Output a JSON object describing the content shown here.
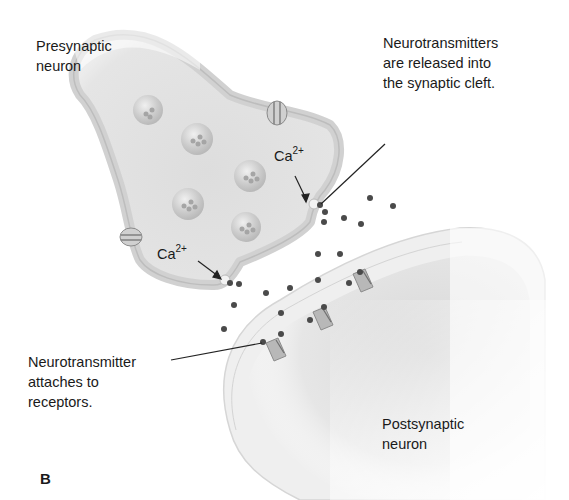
{
  "figure": {
    "panel_label": "B",
    "labels": {
      "presynaptic": "Presynaptic\nneuron",
      "postsynaptic": "Postsynaptic\nneuron",
      "release": "Neurotransmitters\nare released into\nthe synaptic cleft.",
      "attach": "Neurotransmitter\nattaches to\nreceptors."
    },
    "calcium": [
      {
        "base": "Ca",
        "charge": "2+"
      },
      {
        "base": "Ca",
        "charge": "2+"
      }
    ],
    "colors": {
      "membrane_fill": "#e6e6e6",
      "membrane_edge": "#c9c9c9",
      "interior": "#dadada",
      "vesicle": "#cfcfcf",
      "neurotransmitter": "#4a4a4a",
      "receptor": "#b8b8b8",
      "leader_line": "#222222"
    }
  }
}
